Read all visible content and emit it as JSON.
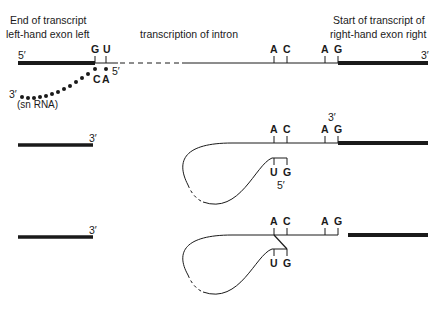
{
  "labels": {
    "left_exon": [
      "End of transcript",
      "left-hand exon left"
    ],
    "intron": "transcription of intron",
    "right_exon": [
      "Start of transcript of",
      "right-hand exon right"
    ],
    "snrna": "(sn RNA)"
  },
  "primes": {
    "five": "5′",
    "three": "3′"
  },
  "bases": {
    "G": "G",
    "U": "U",
    "A": "A",
    "C": "C"
  },
  "colors": {
    "ink": "#1a1a1a",
    "background": "#ffffff"
  }
}
